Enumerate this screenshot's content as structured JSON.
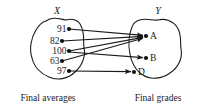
{
  "figure": {
    "type": "function-mapping-diagram",
    "domain_set": {
      "name": "X",
      "caption": "Final averages",
      "elements": [
        {
          "label": "91",
          "x": 64,
          "y": 29
        },
        {
          "label": "82",
          "x": 57,
          "y": 41
        },
        {
          "label": "100",
          "x": 64,
          "y": 51
        },
        {
          "label": "63",
          "x": 57,
          "y": 61
        },
        {
          "label": "97",
          "x": 64,
          "y": 71
        }
      ]
    },
    "codomain_set": {
      "name": "Y",
      "caption": "Final grades",
      "elements": [
        {
          "label": "A",
          "x": 151,
          "y": 36
        },
        {
          "label": "B",
          "x": 151,
          "y": 58
        },
        {
          "label": "D",
          "x": 139,
          "y": 72
        }
      ]
    },
    "mappings": [
      {
        "from": "91",
        "to": "A"
      },
      {
        "from": "82",
        "to": "A"
      },
      {
        "from": "100",
        "to": "A"
      },
      {
        "from": "100",
        "to": "B"
      },
      {
        "from": "63",
        "to": "A"
      },
      {
        "from": "97",
        "to": "D"
      }
    ],
    "colors": {
      "stroke": "#1a1a1a",
      "node": "#111111",
      "background": "#ffffff"
    }
  }
}
